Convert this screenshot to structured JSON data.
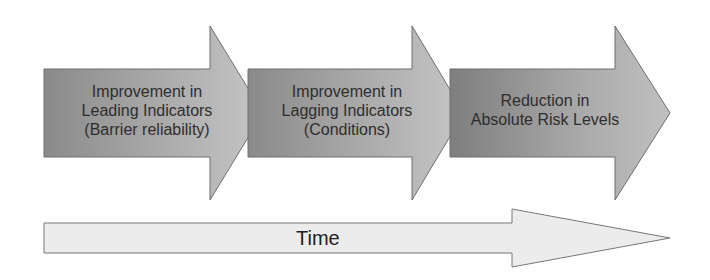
{
  "diagram": {
    "stages": [
      {
        "label": "Improvement in\nLeading Indicators\n(Barrier reliability)"
      },
      {
        "label": "Improvement in\nLagging Indicators\n(Conditions)"
      },
      {
        "label": "Reduction in\nAbsolute Risk Levels"
      }
    ],
    "timeline": {
      "label": "Time"
    },
    "colors": {
      "stage_dark": "#8a8a8a",
      "stage_light": "#c4c4c4",
      "stage_stroke": "#6e6e6e",
      "timeline_fill": "#ececec",
      "timeline_stroke": "#777777",
      "text": "#2e2e2e"
    }
  }
}
